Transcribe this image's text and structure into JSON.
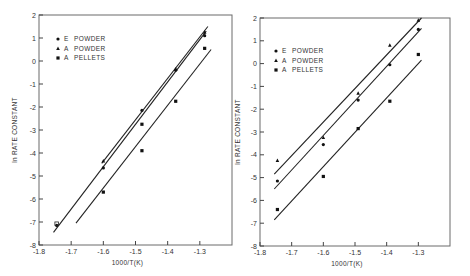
{
  "chart_data": [
    {
      "type": "scatter",
      "title": "",
      "xlabel": "1000/T(K)",
      "ylabel": "ln RATE CONSTANT",
      "xlim": [
        -1.8,
        -1.2
      ],
      "ylim": [
        -8,
        2
      ],
      "xticks": [
        -1.8,
        -1.7,
        -1.6,
        -1.5,
        -1.4,
        -1.3
      ],
      "xtick_labels": [
        "-1.8",
        "-1.7",
        "-1.6",
        "-1.5",
        "-1.4",
        "-1.3"
      ],
      "yticks": [
        2,
        1,
        0,
        -1,
        -2,
        -3,
        -4,
        -5,
        -6,
        -7,
        -8
      ],
      "ytick_labels": [
        "2",
        "1",
        "0",
        "-1",
        "-2",
        "-3",
        "-4",
        "-5",
        "-6",
        "-7",
        "-8"
      ],
      "grid": false,
      "legend_position": "top-left",
      "series": [
        {
          "name": "E POWDER",
          "marker": "circle",
          "points": [
            [
              -1.745,
              -7.15
            ],
            [
              -1.6,
              -4.65
            ],
            [
              -1.48,
              -2.15
            ],
            [
              -1.375,
              -0.4
            ],
            [
              -1.285,
              1.1
            ]
          ],
          "fit_line": [
            [
              -1.755,
              -7.45
            ],
            [
              -1.28,
              1.3
            ]
          ]
        },
        {
          "name": "A POWDER",
          "marker": "triangle",
          "points": [
            [
              -1.6,
              -4.35
            ],
            [
              -1.375,
              -0.35
            ],
            [
              -1.285,
              1.25
            ]
          ],
          "fit_line": [
            [
              -1.605,
              -4.45
            ],
            [
              -1.275,
              1.5
            ]
          ]
        },
        {
          "name": "A PELLETS",
          "marker": "square",
          "points": [
            [
              -1.6,
              -5.7
            ],
            [
              -1.48,
              -3.9
            ],
            [
              -1.48,
              -2.75
            ],
            [
              -1.375,
              -1.75
            ],
            [
              -1.285,
              0.55
            ]
          ],
          "fit_line": [
            [
              -1.685,
              -7.05
            ],
            [
              -1.265,
              0.5
            ]
          ]
        }
      ]
    },
    {
      "type": "scatter",
      "title": "",
      "xlabel": "1000/T(K)",
      "ylabel": "ln RATE CONSTANT",
      "xlim": [
        -1.8,
        -1.2
      ],
      "ylim": [
        -8,
        2
      ],
      "xticks": [
        -1.8,
        -1.7,
        -1.6,
        -1.5,
        -1.4,
        -1.3
      ],
      "xtick_labels": [
        "-1.8",
        "-1.7",
        "-1.6",
        "-1.5",
        "-1.4",
        "-1.3"
      ],
      "yticks": [
        2,
        1,
        0,
        -1,
        -2,
        -3,
        -4,
        -5,
        -6,
        -7,
        -8
      ],
      "ytick_labels": [
        "2",
        "1",
        "0",
        "-1",
        "-2",
        "-3",
        "-4",
        "-5",
        "-6",
        "-7",
        "-8"
      ],
      "grid": false,
      "legend_position": "top-left",
      "series": [
        {
          "name": "E POWDER",
          "marker": "circle",
          "points": [
            [
              -1.745,
              -5.15
            ],
            [
              -1.6,
              -3.55
            ],
            [
              -1.49,
              -1.6
            ],
            [
              -1.39,
              -0.05
            ],
            [
              -1.3,
              1.5
            ]
          ],
          "fit_line": [
            [
              -1.755,
              -5.5
            ],
            [
              -1.29,
              1.55
            ]
          ]
        },
        {
          "name": "A POWDER",
          "marker": "triangle",
          "points": [
            [
              -1.745,
              -4.25
            ],
            [
              -1.6,
              -3.25
            ],
            [
              -1.49,
              -1.3
            ],
            [
              -1.39,
              0.8
            ],
            [
              -1.3,
              1.9
            ]
          ],
          "fit_line": [
            [
              -1.755,
              -4.85
            ],
            [
              -1.29,
              2.0
            ]
          ]
        },
        {
          "name": "A PELLETS",
          "marker": "square",
          "points": [
            [
              -1.745,
              -6.4
            ],
            [
              -1.6,
              -4.95
            ],
            [
              -1.49,
              -2.85
            ],
            [
              -1.39,
              -1.65
            ],
            [
              -1.3,
              0.4
            ]
          ],
          "fit_line": [
            [
              -1.755,
              -6.85
            ],
            [
              -1.29,
              0.15
            ]
          ]
        }
      ]
    }
  ]
}
